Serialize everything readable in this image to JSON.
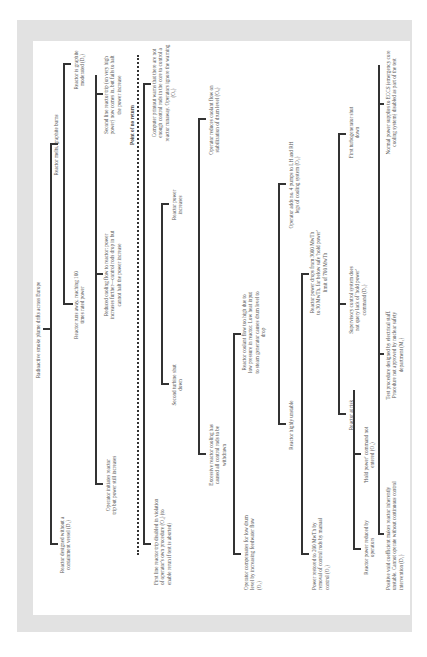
{
  "diagram": {
    "top_event": "Radioactive smoke plume drifts across Europe",
    "point_of_no_return": "Point of no return",
    "nodes": {
      "n1": "Reactor designed without a containment vessel (D₁)",
      "n2": "Reactor melts, graphite burns",
      "n3": "Reactor is graphite moderated (D₂)",
      "n4": "Reactor runs away, reaching 100 times rated power",
      "n5": "Operator initiates reactor trip but power still increases",
      "n6": "Reduced cooling flow to reactor: power increases further—control rods drop in but cannot halt the power increase",
      "n7": "Second line reactor trip (on very high power) now comes in, but fails to halt the power increase",
      "n8": "Computer printout warns that there are not enough control rods in the core to control a reactor runaway. Operators ignore the warning (O₅)",
      "n9": "First line reactor trip disabled in violation of operator's own procedure (O₄) (to enable rerun if test is aborted)",
      "n10": "Second turbine shut down",
      "n11": "Reactor power increases",
      "n12": "Operator reduces coolant flow on stabilization of drum level (O₆)",
      "n13": "Excessive reactor cooling has caused all control rods to be withdrawn",
      "n14": "Reactor coolant flow too high due to low pressure in reactor. Low heat input to steam generator causes drum level to drop",
      "n15": "Operator compensates for low drum level by increasing feedwater flow (O₃)",
      "n16": "Reactor highly unstable",
      "n17": "Operator adds no. 4 pumps to LH and RH legs of cooling system (O₂)",
      "n18": "Power restored to 200 MwTh by removal of control rods by manual control (O₁)",
      "n19": "Reactor power drops from 3000 MwTh to 30 MwTh, far below safe 'hold power' limit of 700 MwTh",
      "n20": "Reactor at risk",
      "n21": "Supervisory control system does not query lack of 'hold power' command (D₃)",
      "n22": "First turbogenerator shut down",
      "n23": "Reactor power reduced by operators",
      "n24": "'Hold power' command not entered (O₁)",
      "n25": "Test procedure designed by electrical staff. Procedure not approved by nuclear safety department (M₁)",
      "n26": "Normal power supplies to ECCS (emergency core cooling system) disabled as part of the test",
      "n27": "Positive void coefficient makes reactor inherently unstable. Cannot operate without continuous control intervention (D₁)"
    }
  }
}
